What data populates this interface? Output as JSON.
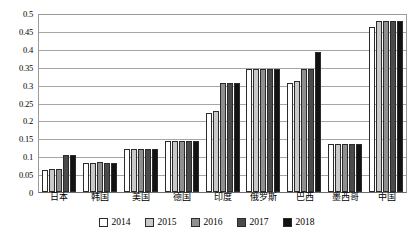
{
  "chart_data": {
    "type": "bar",
    "title": "",
    "subtitle": "",
    "xlabel": "",
    "ylabel": "",
    "ylim": [
      0,
      0.5
    ],
    "yticks": [
      "0",
      "0.05",
      "0.1",
      "0.15",
      "0.2",
      "0.25",
      "0.3",
      "0.35",
      "0.4",
      "0.45",
      "0.5"
    ],
    "ytick_values": [
      0,
      0.05,
      0.1,
      0.15,
      0.2,
      0.25,
      0.3,
      0.35,
      0.4,
      0.45,
      0.5
    ],
    "grid": true,
    "legend_position": "bottom",
    "categories": [
      "日本",
      "韩国",
      "美国",
      "德国",
      "印度",
      "俄罗斯",
      "巴西",
      "墨西哥",
      "中国"
    ],
    "series": [
      {
        "name": "2014",
        "color": "#ffffff",
        "values": [
          0.062,
          0.082,
          0.12,
          0.143,
          0.22,
          0.345,
          0.305,
          0.135,
          0.46
        ]
      },
      {
        "name": "2015",
        "color": "#c9c9c9",
        "values": [
          0.065,
          0.082,
          0.12,
          0.143,
          0.225,
          0.345,
          0.31,
          0.135,
          0.477
        ]
      },
      {
        "name": "2016",
        "color": "#8f8f8f",
        "values": [
          0.063,
          0.083,
          0.12,
          0.143,
          0.305,
          0.345,
          0.345,
          0.135,
          0.477
        ]
      },
      {
        "name": "2017",
        "color": "#4a4a4a",
        "values": [
          0.103,
          0.082,
          0.12,
          0.143,
          0.305,
          0.345,
          0.345,
          0.135,
          0.477
        ]
      },
      {
        "name": "2018",
        "color": "#121212",
        "values": [
          0.103,
          0.081,
          0.12,
          0.143,
          0.305,
          0.345,
          0.39,
          0.135,
          0.477
        ]
      }
    ]
  },
  "legend": {
    "items": [
      {
        "label": "2014",
        "color": "#ffffff"
      },
      {
        "label": "2015",
        "color": "#c9c9c9"
      },
      {
        "label": "2016",
        "color": "#8f8f8f"
      },
      {
        "label": "2017",
        "color": "#4a4a4a"
      },
      {
        "label": "2018",
        "color": "#121212"
      }
    ]
  },
  "colors": {
    "grid": "#a6a6a6",
    "axis": "#6e6e6e",
    "bar_outline": "#2b2b2b",
    "text": "#000000",
    "background": "#ffffff"
  }
}
